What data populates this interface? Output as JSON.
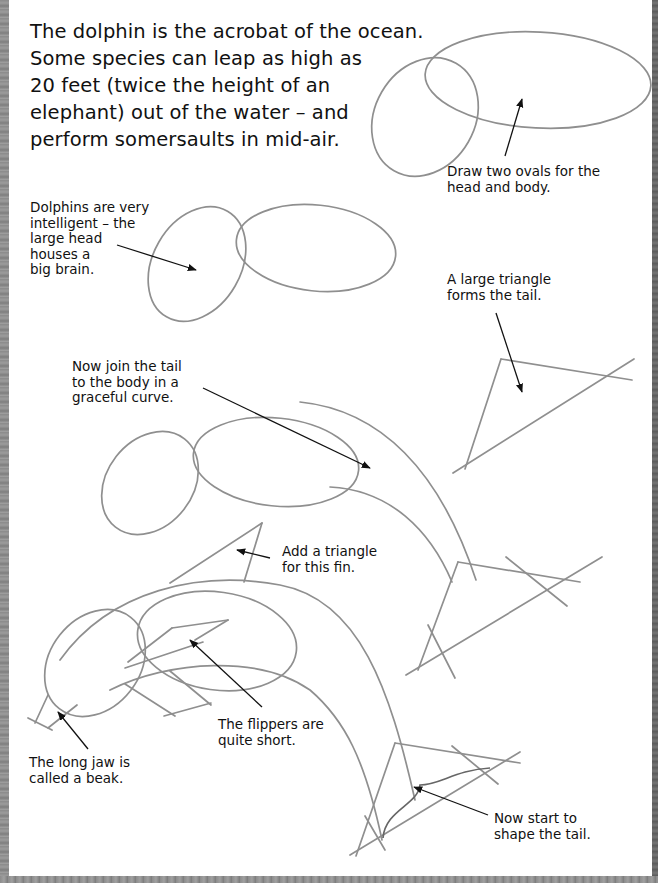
{
  "page": {
    "intro_lines": [
      "The dolphin is the acrobat of the ocean.",
      "Some species can leap as high as",
      "20 feet (twice the height of an",
      "elephant) out of the water – and",
      "perform somersaults in mid-air."
    ]
  },
  "steps": [
    {
      "step": 1,
      "notes": [
        {
          "id": "ovals",
          "lines": [
            "Draw two ovals for the",
            "head and body."
          ]
        }
      ]
    },
    {
      "step": 2,
      "notes": [
        {
          "id": "brain",
          "lines": [
            "Dolphins are very",
            "intelligent – the",
            "large head",
            "houses a",
            "big brain."
          ]
        },
        {
          "id": "tail-triangle",
          "lines": [
            "A large triangle",
            "forms the tail."
          ]
        }
      ]
    },
    {
      "step": 3,
      "notes": [
        {
          "id": "join-tail",
          "lines": [
            "Now join the tail",
            "to the body in a",
            "graceful curve."
          ]
        },
        {
          "id": "fin",
          "lines": [
            "Add a triangle",
            "for this fin."
          ]
        }
      ]
    },
    {
      "step": 4,
      "notes": [
        {
          "id": "flippers",
          "lines": [
            "The flippers are",
            "quite short."
          ]
        },
        {
          "id": "beak",
          "lines": [
            "The long jaw is",
            "called a beak."
          ]
        },
        {
          "id": "shape-tail",
          "lines": [
            "Now start to",
            "shape the tail."
          ]
        }
      ]
    }
  ],
  "colors": {
    "pencil": "#8f8f8f",
    "ink": "#111111",
    "paper": "#ffffff",
    "frame": "#8a8a8a"
  }
}
